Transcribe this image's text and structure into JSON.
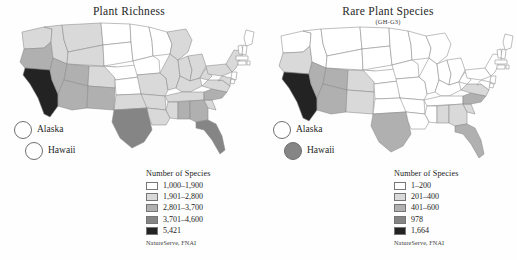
{
  "figure": {
    "background": "#fefefe",
    "panels": [
      {
        "id": "plant-richness",
        "title": "Plant Richness",
        "subtitle": "",
        "legend_title": "Number of Species",
        "source": "NatureServe, FNAI",
        "insets": [
          {
            "name": "Alaska",
            "label": "Alaska",
            "class_index": 0
          },
          {
            "name": "Hawaii",
            "label": "Hawaii",
            "class_index": 0
          }
        ]
      },
      {
        "id": "rare-plant-species",
        "title": "Rare Plant Species",
        "subtitle": "(GH-G3)",
        "legend_title": "Number of Species",
        "source": "NatureServe, FNAI",
        "insets": [
          {
            "name": "Alaska",
            "label": "Alaska",
            "class_index": 0
          },
          {
            "name": "Hawaii",
            "label": "Hawaii",
            "class_index": 3
          }
        ]
      }
    ]
  },
  "palette": [
    "#ffffff",
    "#d9d9d9",
    "#b0b0b0",
    "#858585",
    "#232323"
  ],
  "chart_data": [
    {
      "type": "heatmap",
      "subtype": "choropleth-map",
      "title": "Plant Richness",
      "subtitle": "",
      "xlabel": "",
      "ylabel": "",
      "grid": false,
      "legend_position": "bottom-right",
      "legend_title": "Number of Species",
      "source": "NatureServe, FNAI",
      "classes": [
        {
          "label": "1,000–1,900",
          "color": "#ffffff",
          "min": 1000,
          "max": 1900
        },
        {
          "label": "1,901–2,800",
          "color": "#d9d9d9",
          "min": 1901,
          "max": 2800
        },
        {
          "label": "2,801–3,700",
          "color": "#b0b0b0",
          "min": 2801,
          "max": 3700
        },
        {
          "label": "3,701–4,600",
          "color": "#858585",
          "min": 3701,
          "max": 4600
        },
        {
          "label": "5,421",
          "color": "#232323",
          "min": 5421,
          "max": 5421
        }
      ],
      "regions": [
        {
          "code": "WA",
          "class_index": 1
        },
        {
          "code": "OR",
          "class_index": 2
        },
        {
          "code": "CA",
          "class_index": 4
        },
        {
          "code": "ID",
          "class_index": 1
        },
        {
          "code": "NV",
          "class_index": 2
        },
        {
          "code": "MT",
          "class_index": 1
        },
        {
          "code": "WY",
          "class_index": 1
        },
        {
          "code": "UT",
          "class_index": 2
        },
        {
          "code": "AZ",
          "class_index": 2
        },
        {
          "code": "CO",
          "class_index": 1
        },
        {
          "code": "NM",
          "class_index": 2
        },
        {
          "code": "ND",
          "class_index": 0
        },
        {
          "code": "SD",
          "class_index": 0
        },
        {
          "code": "NE",
          "class_index": 0
        },
        {
          "code": "KS",
          "class_index": 0
        },
        {
          "code": "OK",
          "class_index": 1
        },
        {
          "code": "TX",
          "class_index": 3
        },
        {
          "code": "MN",
          "class_index": 0
        },
        {
          "code": "IA",
          "class_index": 0
        },
        {
          "code": "MO",
          "class_index": 1
        },
        {
          "code": "AR",
          "class_index": 1
        },
        {
          "code": "LA",
          "class_index": 1
        },
        {
          "code": "WI",
          "class_index": 0
        },
        {
          "code": "IL",
          "class_index": 1
        },
        {
          "code": "MI",
          "class_index": 1
        },
        {
          "code": "IN",
          "class_index": 1
        },
        {
          "code": "OH",
          "class_index": 1
        },
        {
          "code": "KY",
          "class_index": 1
        },
        {
          "code": "TN",
          "class_index": 1
        },
        {
          "code": "MS",
          "class_index": 1
        },
        {
          "code": "AL",
          "class_index": 2
        },
        {
          "code": "GA",
          "class_index": 2
        },
        {
          "code": "FL",
          "class_index": 3
        },
        {
          "code": "SC",
          "class_index": 1
        },
        {
          "code": "NC",
          "class_index": 2
        },
        {
          "code": "VA",
          "class_index": 1
        },
        {
          "code": "WV",
          "class_index": 1
        },
        {
          "code": "PA",
          "class_index": 1
        },
        {
          "code": "NY",
          "class_index": 1
        },
        {
          "code": "ME",
          "class_index": 0
        },
        {
          "code": "VT",
          "class_index": 0
        },
        {
          "code": "NH",
          "class_index": 0
        },
        {
          "code": "MA",
          "class_index": 0
        },
        {
          "code": "CT",
          "class_index": 0
        },
        {
          "code": "RI",
          "class_index": 0
        },
        {
          "code": "NJ",
          "class_index": 0
        },
        {
          "code": "DE",
          "class_index": 0
        },
        {
          "code": "MD",
          "class_index": 1
        },
        {
          "code": "AK",
          "class_index": 0
        },
        {
          "code": "HI",
          "class_index": 0
        }
      ]
    },
    {
      "type": "heatmap",
      "subtype": "choropleth-map",
      "title": "Rare Plant Species",
      "subtitle": "(GH-G3)",
      "xlabel": "",
      "ylabel": "",
      "grid": false,
      "legend_position": "bottom-right",
      "legend_title": "Number of Species",
      "source": "NatureServe, FNAI",
      "classes": [
        {
          "label": "1–200",
          "color": "#ffffff",
          "min": 1,
          "max": 200
        },
        {
          "label": "201–400",
          "color": "#d9d9d9",
          "min": 201,
          "max": 400
        },
        {
          "label": "401–600",
          "color": "#b0b0b0",
          "min": 401,
          "max": 600
        },
        {
          "label": "978",
          "color": "#858585",
          "min": 978,
          "max": 978
        },
        {
          "label": "1,664",
          "color": "#232323",
          "min": 1664,
          "max": 1664
        }
      ],
      "regions": [
        {
          "code": "WA",
          "class_index": 0
        },
        {
          "code": "OR",
          "class_index": 1
        },
        {
          "code": "CA",
          "class_index": 4
        },
        {
          "code": "ID",
          "class_index": 0
        },
        {
          "code": "NV",
          "class_index": 2
        },
        {
          "code": "MT",
          "class_index": 0
        },
        {
          "code": "WY",
          "class_index": 0
        },
        {
          "code": "UT",
          "class_index": 2
        },
        {
          "code": "AZ",
          "class_index": 2
        },
        {
          "code": "CO",
          "class_index": 1
        },
        {
          "code": "NM",
          "class_index": 1
        },
        {
          "code": "ND",
          "class_index": 0
        },
        {
          "code": "SD",
          "class_index": 0
        },
        {
          "code": "NE",
          "class_index": 0
        },
        {
          "code": "KS",
          "class_index": 0
        },
        {
          "code": "OK",
          "class_index": 0
        },
        {
          "code": "TX",
          "class_index": 2
        },
        {
          "code": "MN",
          "class_index": 0
        },
        {
          "code": "IA",
          "class_index": 0
        },
        {
          "code": "MO",
          "class_index": 0
        },
        {
          "code": "AR",
          "class_index": 0
        },
        {
          "code": "LA",
          "class_index": 0
        },
        {
          "code": "WI",
          "class_index": 0
        },
        {
          "code": "IL",
          "class_index": 0
        },
        {
          "code": "MI",
          "class_index": 0
        },
        {
          "code": "IN",
          "class_index": 0
        },
        {
          "code": "OH",
          "class_index": 0
        },
        {
          "code": "KY",
          "class_index": 0
        },
        {
          "code": "TN",
          "class_index": 0
        },
        {
          "code": "MS",
          "class_index": 0
        },
        {
          "code": "AL",
          "class_index": 1
        },
        {
          "code": "GA",
          "class_index": 1
        },
        {
          "code": "FL",
          "class_index": 2
        },
        {
          "code": "SC",
          "class_index": 1
        },
        {
          "code": "NC",
          "class_index": 2
        },
        {
          "code": "VA",
          "class_index": 1
        },
        {
          "code": "WV",
          "class_index": 0
        },
        {
          "code": "PA",
          "class_index": 0
        },
        {
          "code": "NY",
          "class_index": 0
        },
        {
          "code": "ME",
          "class_index": 0
        },
        {
          "code": "VT",
          "class_index": 0
        },
        {
          "code": "NH",
          "class_index": 0
        },
        {
          "code": "MA",
          "class_index": 0
        },
        {
          "code": "CT",
          "class_index": 0
        },
        {
          "code": "RI",
          "class_index": 0
        },
        {
          "code": "NJ",
          "class_index": 0
        },
        {
          "code": "DE",
          "class_index": 0
        },
        {
          "code": "MD",
          "class_index": 0
        },
        {
          "code": "AK",
          "class_index": 0
        },
        {
          "code": "HI",
          "class_index": 3
        }
      ]
    }
  ]
}
